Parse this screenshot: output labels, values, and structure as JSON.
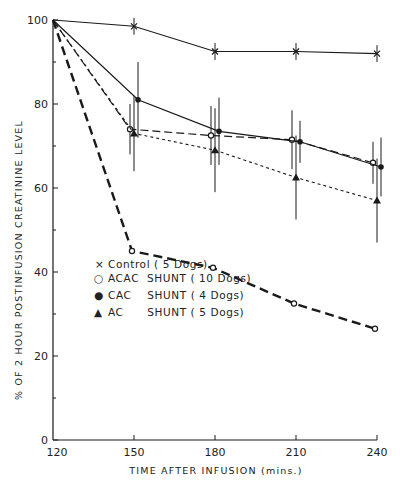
{
  "chart_data": {
    "type": "line",
    "title": "",
    "xlabel": "TIME AFTER INFUSION (mins.)",
    "ylabel": "% OF 2 HOUR POSTINFUSION CREATININE LEVEL",
    "x": [
      120,
      150,
      180,
      210,
      240
    ],
    "xticks": [
      "120",
      "150",
      "180",
      "210",
      "240"
    ],
    "yticks": [
      "0",
      "20",
      "40",
      "60",
      "80",
      "100"
    ],
    "xlim": [
      120,
      240
    ],
    "ylim": [
      0,
      100
    ],
    "grid": false,
    "legend_position": "inside-left-middle",
    "legend": [
      {
        "marker": "×",
        "label": "Control ( 5 Dogs)"
      },
      {
        "marker": "○",
        "label": "ACAC  SHUNT ( 10 Dogs)"
      },
      {
        "marker": "●",
        "label": "CAC    SHUNT ( 4 Dogs)"
      },
      {
        "marker": "▲",
        "label": "AC      SHUNT ( 5 Dogs)"
      }
    ],
    "series": [
      {
        "name": "Control (5 Dogs)",
        "marker": "x",
        "line": "solid-thin",
        "values": [
          100,
          98.5,
          92.5,
          92.5,
          92
        ],
        "error": [
          0,
          2,
          2,
          2,
          2
        ]
      },
      {
        "name": "ACAC SHUNT (10 Dogs)",
        "marker": "open-circle",
        "line": "bold-dashed",
        "values": [
          100,
          45,
          41,
          32.5,
          26.5
        ],
        "error": [
          0,
          0,
          0,
          0,
          0
        ]
      },
      {
        "name": "Open-circle series with error bars",
        "marker": "open-circle",
        "line": "long-dashed",
        "values": [
          100,
          74,
          72.5,
          71.5,
          66
        ],
        "error": [
          0,
          6,
          7,
          7,
          5
        ]
      },
      {
        "name": "CAC SHUNT (4 Dogs)",
        "marker": "filled-circle",
        "line": "solid",
        "values": [
          100,
          81,
          73.5,
          71,
          65
        ],
        "error": [
          0,
          9,
          8,
          5,
          7
        ]
      },
      {
        "name": "AC SHUNT (5 Dogs)",
        "marker": "filled-triangle",
        "line": "short-dotted",
        "values": [
          100,
          73,
          69,
          62.5,
          57
        ],
        "error": [
          0,
          9,
          10,
          10,
          10
        ]
      }
    ]
  },
  "axes": {
    "x_title": "TIME AFTER  INFUSION (mins.)",
    "y_title": "% OF 2 HOUR POSTINFUSION CREATININE LEVEL",
    "x_ticks": [
      "120",
      "150",
      "180",
      "210",
      "240"
    ],
    "y_ticks": [
      "0",
      "20",
      "40",
      "60",
      "80",
      "100"
    ]
  },
  "legend": {
    "items": [
      {
        "symbol": "×",
        "label": "Control ( 5 Dogs)"
      },
      {
        "symbol": "○",
        "label": "ACAC  SHUNT ( 10 Dogs)"
      },
      {
        "symbol": "●",
        "label": "CAC    SHUNT ( 4 Dogs)"
      },
      {
        "symbol": "▲",
        "label": "AC      SHUNT ( 5 Dogs)"
      }
    ]
  },
  "colors": {
    "ink": "#1a1a1a",
    "background": "#ffffff"
  }
}
